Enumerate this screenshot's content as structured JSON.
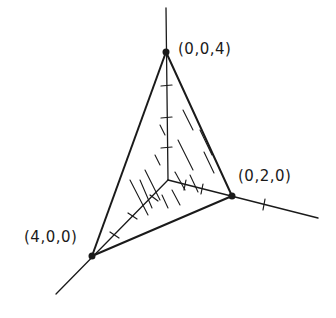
{
  "diagram": {
    "type": "3d-coordinate-tetrahedron",
    "vertices": [
      {
        "label": "(0,0,4)",
        "point": [
          0,
          0,
          4
        ]
      },
      {
        "label": "(0,2,0)",
        "point": [
          0,
          2,
          0
        ]
      },
      {
        "label": "(4,0,0)",
        "point": [
          4,
          0,
          0
        ]
      }
    ],
    "colors": {
      "stroke": "#1a1a1a",
      "background": "#ffffff"
    }
  }
}
